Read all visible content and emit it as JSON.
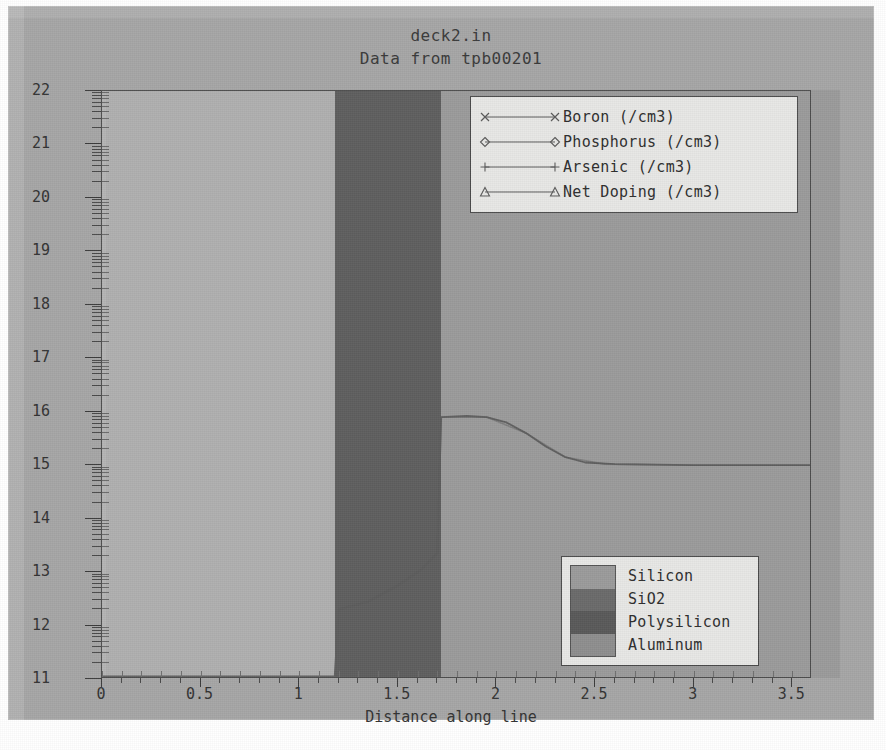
{
  "chart_data": {
    "type": "line",
    "title": "deck2.in",
    "subtitle": "Data from tpb00201",
    "xlabel": "Distance along line",
    "ylabel": "",
    "xlim": [
      0,
      3.6
    ],
    "ylim": [
      11,
      22
    ],
    "grid": false,
    "y_scale": "log10-decades",
    "xticks": [
      "0",
      "0.5",
      "1",
      "1.5",
      "2",
      "2.5",
      "3",
      "3.5"
    ],
    "xtick_values": [
      0,
      0.5,
      1,
      1.5,
      2,
      2.5,
      3,
      3.5
    ],
    "yticks": [
      "22",
      "21",
      "20",
      "19",
      "18",
      "17",
      "16",
      "15",
      "14",
      "13",
      "12",
      "11"
    ],
    "ytick_values": [
      22,
      21,
      20,
      19,
      18,
      17,
      16,
      15,
      14,
      13,
      12,
      11
    ],
    "legend_position": "top-right",
    "series": [
      {
        "name": "Boron (/cm3)",
        "marker": "x",
        "color": "#5e5e5e",
        "points": [
          [
            0.0,
            11.05
          ],
          [
            0.6,
            11.05
          ],
          [
            1.0,
            11.05
          ],
          [
            1.18,
            11.05
          ],
          [
            1.2,
            12.3
          ],
          [
            1.35,
            12.45
          ],
          [
            1.5,
            12.75
          ],
          [
            1.62,
            13.05
          ],
          [
            1.7,
            13.35
          ],
          [
            1.72,
            15.9
          ],
          [
            1.85,
            15.92
          ],
          [
            1.95,
            15.9
          ],
          [
            2.05,
            15.8
          ],
          [
            2.15,
            15.6
          ],
          [
            2.25,
            15.35
          ],
          [
            2.35,
            15.15
          ],
          [
            2.45,
            15.05
          ],
          [
            2.6,
            15.02
          ],
          [
            2.8,
            15.01
          ],
          [
            3.0,
            15.0
          ],
          [
            3.3,
            15.0
          ],
          [
            3.6,
            15.0
          ]
        ]
      },
      {
        "name": "Phosphorus (/cm3)",
        "marker": "diamond",
        "color": "#6a6a6a",
        "points": [
          [
            0.0,
            11.02
          ],
          [
            1.2,
            11.02
          ],
          [
            1.72,
            11.02
          ],
          [
            3.6,
            11.02
          ]
        ]
      },
      {
        "name": "Arsenic (/cm3)",
        "marker": "plus",
        "color": "#717171",
        "points": [
          [
            0.0,
            11.02
          ],
          [
            1.2,
            11.02
          ],
          [
            1.72,
            11.02
          ],
          [
            3.6,
            11.02
          ]
        ]
      },
      {
        "name": "Net Doping (/cm3)",
        "marker": "triangle",
        "color": "#5e5e5e",
        "points": [
          [
            1.2,
            12.3
          ],
          [
            1.35,
            12.45
          ],
          [
            1.5,
            12.75
          ],
          [
            1.62,
            13.05
          ],
          [
            1.7,
            13.35
          ],
          [
            1.72,
            15.9
          ],
          [
            1.95,
            15.9
          ],
          [
            2.15,
            15.6
          ],
          [
            2.35,
            15.15
          ],
          [
            2.55,
            15.02
          ],
          [
            3.0,
            15.0
          ],
          [
            3.6,
            15.0
          ]
        ]
      }
    ],
    "material_regions": [
      {
        "name": "Aluminum",
        "x_start": 0.0,
        "x_end": 0.02,
        "color": "#b5b5b5"
      },
      {
        "name": "SiO2",
        "x_start": 0.02,
        "x_end": 1.18,
        "color": "#b0b0b0"
      },
      {
        "name": "Polysilicon",
        "x_start": 1.18,
        "x_end": 1.72,
        "color": "#5f5f5f"
      },
      {
        "name": "Silicon",
        "x_start": 1.72,
        "x_end": 3.6,
        "color": "#9b9b9b"
      }
    ]
  },
  "series_legend": {
    "items": [
      {
        "label": "Boron  (/cm3)",
        "marker": "x"
      },
      {
        "label": "Phosphorus  (/cm3)",
        "marker": "diamond"
      },
      {
        "label": "Arsenic  (/cm3)",
        "marker": "plus"
      },
      {
        "label": "Net Doping  (/cm3)",
        "marker": "triangle"
      }
    ]
  },
  "material_legend": {
    "items": [
      {
        "label": "Silicon",
        "color": "#9b9b9b"
      },
      {
        "label": "SiO2",
        "color": "#6b6b6b"
      },
      {
        "label": "Polysilicon",
        "color": "#5a5a5a"
      },
      {
        "label": "Aluminum",
        "color": "#8e8e8e"
      }
    ]
  },
  "colors": {
    "page_background": "#ffffff",
    "canvas_background": "#a6a6a6",
    "plot_background": "#9b9b9b",
    "frame": "#4d4d4d",
    "legend_background": "#e8e8e6",
    "text": "#333333",
    "curve": "#555555"
  }
}
